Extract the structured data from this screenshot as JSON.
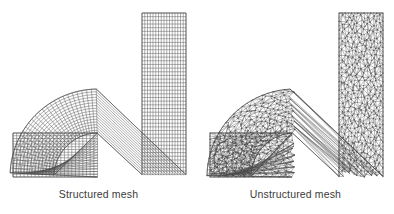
{
  "figure": {
    "background_color": "#ffffff",
    "width": 394,
    "height": 214,
    "panel_count": 2
  },
  "panels": [
    {
      "id": "structured",
      "caption": "Structured mesh",
      "mesh_type": "quadrilateral structured grid",
      "line_color": "#4d4d4d",
      "fill_color": "#ffffff",
      "geometry": {
        "shape": "90-degree elbow duct",
        "inlet": "horizontal leg on lower left",
        "outlet": "vertical leg on upper right",
        "duct_width": 45,
        "bend_inner_radius": 30,
        "bend_outer_radius": 75
      },
      "grid": {
        "cells_across_width": 16,
        "cells_along_horizontal_leg": 34,
        "cells_along_vertical_leg": 30,
        "cells_along_bend": 30
      }
    },
    {
      "id": "unstructured",
      "caption": "Unstructured mesh",
      "mesh_type": "triangular unstructured grid",
      "line_color": "#4a4a4a",
      "fill_color": "#ffffff",
      "geometry": {
        "shape": "90-degree elbow duct",
        "inlet": "horizontal leg on lower left",
        "outlet": "vertical leg on upper right",
        "duct_width": 48,
        "bend_inner_radius": 30,
        "bend_outer_radius": 78
      },
      "grid": {
        "nodes_across_width": 14,
        "triangles_approx": 2100,
        "element_shape": "triangle"
      }
    }
  ],
  "chart_data": {
    "type": "diagram",
    "title": "",
    "subtitle": "",
    "panels": [
      "Structured mesh",
      "Unstructured mesh"
    ],
    "labels": [
      "Structured mesh",
      "Unstructured mesh"
    ]
  }
}
